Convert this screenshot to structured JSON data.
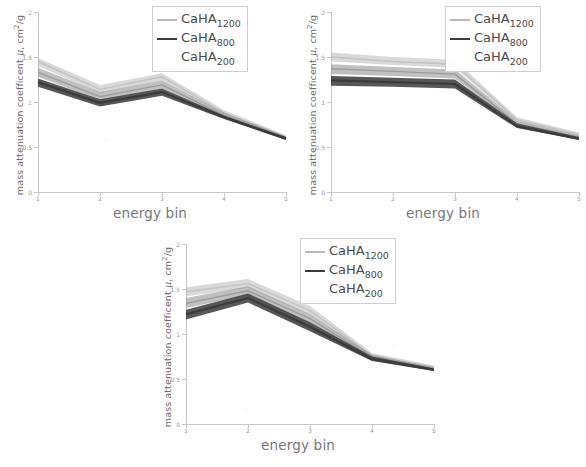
{
  "figure": {
    "panel_count": 3,
    "series_names": [
      "CaHA1200",
      "CaHA800",
      "CaHA200"
    ],
    "colors": {
      "caha1200": "#b9b9b9",
      "caha800": "#3a3a3a",
      "caha200": "#8c8c8c",
      "axis": "#c9c9c9",
      "text": "#6d6d6d",
      "background": "#ffffff"
    }
  },
  "legend": {
    "entries": [
      {
        "label_main": "CaHA",
        "label_sub": "1200",
        "swatch": "line-light"
      },
      {
        "label_main": "CaHA",
        "label_sub": "800",
        "swatch": "line-dark"
      },
      {
        "label_main": "CaHA",
        "label_sub": "200",
        "swatch": "none"
      }
    ]
  },
  "axes": {
    "xlabel": "energy bin",
    "ylabel_prefix": "mass attenuation coefficent ",
    "ylabel_mu": "μ",
    "ylabel_unit_pre": ", cm",
    "ylabel_unit_sup": "2",
    "ylabel_unit_post": "/g",
    "x_ticks": [
      "1",
      "2",
      "3",
      "4",
      "5"
    ],
    "y_ticks": [
      "0",
      "0.5",
      "1",
      "1.5",
      "2"
    ],
    "xlim": [
      1,
      5
    ],
    "ylim": [
      0,
      2
    ]
  },
  "chart_data": [
    {
      "type": "line",
      "panel": 1,
      "title": "",
      "xlabel": "energy bin",
      "ylabel": "mass attenuation coefficent μ, cm2/g",
      "x": [
        1,
        2,
        3,
        4,
        5
      ],
      "xlim": [
        1,
        5
      ],
      "ylim": [
        0,
        2
      ],
      "grid": false,
      "legend_position": "top-right",
      "series": [
        {
          "name": "CaHA1200",
          "values": [
            1.45,
            1.14,
            1.28,
            0.88,
            0.61
          ],
          "band_low": [
            1.4,
            1.1,
            1.24,
            0.86,
            0.6
          ],
          "band_high": [
            1.49,
            1.19,
            1.32,
            0.91,
            0.63
          ],
          "color": "#b9b9b9"
        },
        {
          "name": "CaHA800",
          "values": [
            1.22,
            0.99,
            1.11,
            0.83,
            0.59
          ],
          "band_low": [
            1.17,
            0.95,
            1.07,
            0.81,
            0.58
          ],
          "band_high": [
            1.26,
            1.03,
            1.15,
            0.85,
            0.61
          ],
          "color": "#3a3a3a"
        },
        {
          "name": "CaHA200",
          "values": [
            1.33,
            1.06,
            1.19,
            0.85,
            0.6
          ],
          "band_low": [
            1.28,
            1.02,
            1.15,
            0.83,
            0.59
          ],
          "band_high": [
            1.38,
            1.11,
            1.24,
            0.88,
            0.62
          ],
          "color": "#8c8c8c"
        }
      ]
    },
    {
      "type": "line",
      "panel": 2,
      "title": "",
      "xlabel": "energy bin",
      "ylabel": "mass attenuation coefficent μ, cm2/g",
      "x": [
        1,
        2,
        3,
        4,
        5
      ],
      "xlim": [
        1,
        5
      ],
      "ylim": [
        0,
        2
      ],
      "grid": false,
      "legend_position": "top-right",
      "series": [
        {
          "name": "CaHA1200",
          "values": [
            1.5,
            1.45,
            1.42,
            0.8,
            0.64
          ],
          "band_low": [
            1.45,
            1.41,
            1.38,
            0.78,
            0.62
          ],
          "band_high": [
            1.55,
            1.5,
            1.47,
            0.83,
            0.66
          ],
          "color": "#b9b9b9"
        },
        {
          "name": "CaHA800",
          "values": [
            1.24,
            1.22,
            1.2,
            0.73,
            0.59
          ],
          "band_low": [
            1.18,
            1.17,
            1.15,
            0.71,
            0.58
          ],
          "band_high": [
            1.29,
            1.27,
            1.25,
            0.76,
            0.61
          ],
          "color": "#3a3a3a"
        },
        {
          "name": "CaHA200",
          "values": [
            1.37,
            1.34,
            1.31,
            0.76,
            0.61
          ],
          "band_low": [
            1.31,
            1.29,
            1.26,
            0.74,
            0.6
          ],
          "band_high": [
            1.42,
            1.39,
            1.36,
            0.79,
            0.63
          ],
          "color": "#8c8c8c"
        }
      ]
    },
    {
      "type": "line",
      "panel": 3,
      "title": "",
      "xlabel": "energy bin",
      "ylabel": "mass attenuation coefficent μ, cm2/g",
      "x": [
        1,
        2,
        3,
        4,
        5
      ],
      "xlim": [
        1,
        5
      ],
      "ylim": [
        0,
        2
      ],
      "grid": false,
      "legend_position": "top-right",
      "series": [
        {
          "name": "CaHA1200",
          "values": [
            1.47,
            1.56,
            1.26,
            0.76,
            0.63
          ],
          "band_low": [
            1.42,
            1.51,
            1.21,
            0.74,
            0.62
          ],
          "band_high": [
            1.52,
            1.61,
            1.31,
            0.79,
            0.65
          ],
          "color": "#b9b9b9"
        },
        {
          "name": "CaHA800",
          "values": [
            1.22,
            1.4,
            1.08,
            0.72,
            0.6
          ],
          "band_low": [
            1.16,
            1.35,
            1.03,
            0.7,
            0.59
          ],
          "band_high": [
            1.27,
            1.45,
            1.13,
            0.75,
            0.62
          ],
          "color": "#3a3a3a"
        },
        {
          "name": "CaHA200",
          "values": [
            1.34,
            1.48,
            1.17,
            0.74,
            0.61
          ],
          "band_low": [
            1.29,
            1.43,
            1.12,
            0.72,
            0.6
          ],
          "band_high": [
            1.4,
            1.53,
            1.22,
            0.77,
            0.63
          ],
          "color": "#8c8c8c"
        }
      ]
    }
  ]
}
